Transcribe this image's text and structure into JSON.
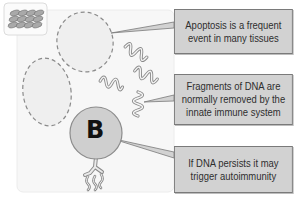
{
  "diagram": {
    "icon": "epithelial-tissue-icon",
    "cell_label": "B",
    "cell_type": "b-cell",
    "callouts": [
      {
        "lines": [
          "Apoptosis is a frequent",
          "event in many tissues"
        ]
      },
      {
        "lines": [
          "Fragments of DNA are",
          "normally removed by the",
          "innate immune system"
        ]
      },
      {
        "lines": [
          "If DNA persists it may",
          "trigger autoimmunity"
        ]
      }
    ],
    "colors": {
      "panel_bg": "#f7f7f7",
      "callout_bg": "#d2d2d2",
      "callout_border": "#7a7a7a",
      "cell_fill": "#cfcfcf",
      "dashed_cell_fill": "#efefef",
      "dna_stroke": "#8a8a8a"
    }
  }
}
